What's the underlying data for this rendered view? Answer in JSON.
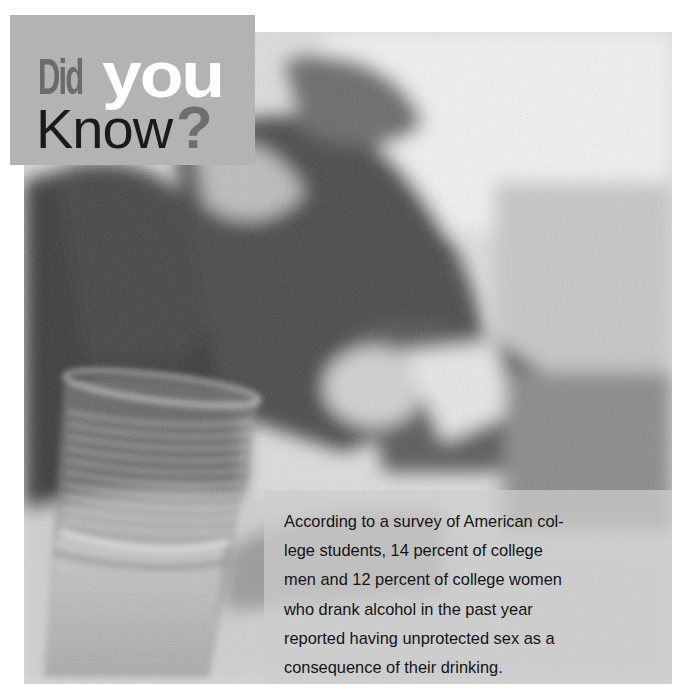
{
  "header": {
    "word_did": "Did",
    "word_you": "you",
    "word_know": "Know",
    "question_mark": "?"
  },
  "fact": {
    "lines": [
      "According to a survey of American col-",
      "lege students, 14 percent of college",
      "men and 12 percent of college women",
      "who drank alcohol in the past year",
      "reported having unprotected sex as a",
      "consequence of their drinking."
    ],
    "full_text": "According to a survey of American college students, 14 percent of college men and 12 percent of college women who drank alcohol in the past year reported having unprotected sex as a consequence of their drinking."
  },
  "photo": {
    "description": "Blurred grayscale photo of a person lying on a couch with a partly filled ribbed drinking glass in the foreground",
    "subjects": [
      "reclining-person",
      "drinking-glass"
    ]
  },
  "colors": {
    "header_box": "#b3b3b3",
    "did_text": "#6b6b6b",
    "you_text": "#ffffff",
    "know_text": "#1a1a1a",
    "question_mark": "#6e6e6e",
    "fact_text": "#141414",
    "fact_box": "#cdcdcd"
  }
}
